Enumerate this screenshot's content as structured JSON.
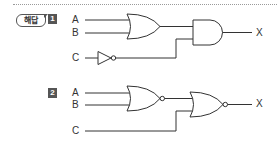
{
  "header": {
    "badge_label": "해답"
  },
  "problems": [
    {
      "number": "1",
      "inputs": [
        "A",
        "B",
        "C"
      ],
      "output": "X",
      "gates": [
        "OR",
        "NOT",
        "AND"
      ]
    },
    {
      "number": "2",
      "inputs": [
        "A",
        "B",
        "C"
      ],
      "output": "X",
      "gates": [
        "NOR",
        "NOR"
      ]
    }
  ],
  "colors": {
    "line": "#333333",
    "badge": "#555555",
    "divider": "#9a9a9a"
  }
}
